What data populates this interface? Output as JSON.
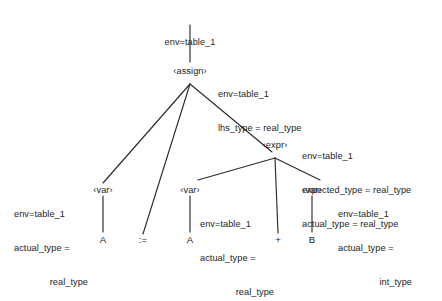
{
  "figure": {
    "ink_color": "#2b2b2b",
    "background_color": "#ffffff"
  },
  "nodes": {
    "root_annotation": "env=table_1",
    "assign": {
      "label": "‹assign›",
      "annotation_lines": [
        "env=table_1",
        "lhs_type = real_type"
      ]
    },
    "expr": {
      "label": "‹expr›",
      "annotation_lines": [
        "env=table_1",
        "expected_type = real_type",
        "actual_type = real_type"
      ]
    },
    "var_lhs": {
      "label": "‹var›",
      "annotation_lines": [
        "env=table_1",
        "actual_type =",
        "real_type"
      ],
      "leaf": "A"
    },
    "assign_op": {
      "leaf": ":="
    },
    "var_a": {
      "label": "‹var›",
      "annotation_lines": [
        "env=table_1",
        "actual_type =",
        "real_type"
      ],
      "leaf": "A"
    },
    "plus_op": {
      "leaf": "+"
    },
    "var_b": {
      "label": "‹var›",
      "annotation_lines": [
        "env=table_1",
        "actual_type =",
        "int_type"
      ],
      "leaf": "B"
    }
  }
}
